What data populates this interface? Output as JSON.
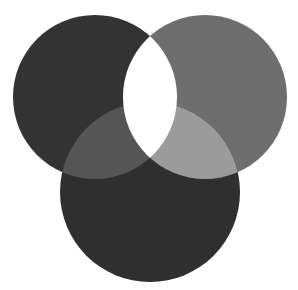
{
  "diagram": {
    "type": "venn",
    "sets": 3,
    "background": "#ffffff",
    "circles": [
      {
        "name": "left",
        "cx": 95,
        "cy": 97,
        "r": 82,
        "fill": "#333333"
      },
      {
        "name": "right",
        "cx": 205,
        "cy": 97,
        "r": 82,
        "fill": "#6e6e6e"
      },
      {
        "name": "bottom",
        "cx": 150,
        "cy": 192,
        "r": 90,
        "fill": "#2f2f2f"
      }
    ],
    "overlaps": {
      "left_right": "#ffffff",
      "left_bottom": "#555555",
      "right_bottom": "#9b9b9b",
      "all_three": "#ffffff"
    }
  }
}
